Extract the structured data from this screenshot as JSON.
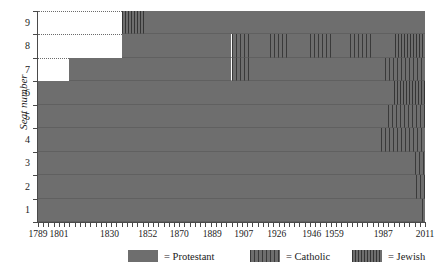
{
  "chart_data": {
    "type": "area",
    "title": "",
    "xlabel": "",
    "ylabel": "Seat number",
    "xlim": [
      1789,
      2011
    ],
    "ylim": [
      0,
      9
    ],
    "grid": false,
    "legend_position": "bottom",
    "x_tick_labels": [
      "1789",
      "1801",
      "1830",
      "1852",
      "1870",
      "1889",
      "1907",
      "1926",
      "1946",
      "1959",
      "1987",
      "2011"
    ],
    "y_tick_labels": [
      "1",
      "2",
      "3",
      "4",
      "5",
      "6",
      "7",
      "8",
      "9"
    ],
    "categories": [
      "Protestant",
      "Catholic",
      "Jewish"
    ],
    "series": [
      {
        "name": "Protestant",
        "pattern": "solid-gray",
        "color": "#6e6e6e"
      },
      {
        "name": "Catholic",
        "pattern": "vertical-lines-wide",
        "color": "#3a3a3a"
      },
      {
        "name": "Jewish",
        "pattern": "vertical-lines-dense",
        "color": "#353535"
      }
    ],
    "seat_start_years": {
      "seat_1": 1789,
      "seat_2": 1789,
      "seat_3": 1789,
      "seat_4": 1789,
      "seat_5": 1789,
      "seat_6": 1789,
      "seat_7": 1807,
      "seat_8": 1837,
      "seat_9": 1837
    },
    "seat_timelines": [
      {
        "seat": 9,
        "segments": [
          {
            "start": 1837,
            "end": 1851,
            "faith": "Jewish"
          },
          {
            "start": 1851,
            "end": 2011,
            "faith": "Protestant"
          }
        ]
      },
      {
        "seat": 8,
        "segments": [
          {
            "start": 1837,
            "end": 1900,
            "faith": "Protestant"
          },
          {
            "start": 1900,
            "end": 1911,
            "faith": "Catholic"
          },
          {
            "start": 1911,
            "end": 1922,
            "faith": "Protestant"
          },
          {
            "start": 1922,
            "end": 1933,
            "faith": "Catholic"
          },
          {
            "start": 1933,
            "end": 1945,
            "faith": "Protestant"
          },
          {
            "start": 1945,
            "end": 1957,
            "faith": "Catholic"
          },
          {
            "start": 1957,
            "end": 1968,
            "faith": "Protestant"
          },
          {
            "start": 1968,
            "end": 1980,
            "faith": "Catholic"
          },
          {
            "start": 1980,
            "end": 1994,
            "faith": "Protestant"
          },
          {
            "start": 1994,
            "end": 2011,
            "faith": "Jewish"
          }
        ]
      },
      {
        "seat": 7,
        "segments": [
          {
            "start": 1807,
            "end": 1900,
            "faith": "Protestant"
          },
          {
            "start": 1900,
            "end": 1912,
            "faith": "Catholic"
          },
          {
            "start": 1912,
            "end": 1988,
            "faith": "Protestant"
          },
          {
            "start": 1988,
            "end": 2011,
            "faith": "Catholic"
          }
        ]
      },
      {
        "seat": 6,
        "segments": [
          {
            "start": 1789,
            "end": 1993,
            "faith": "Protestant"
          },
          {
            "start": 1993,
            "end": 2011,
            "faith": "Jewish"
          }
        ]
      },
      {
        "seat": 5,
        "segments": [
          {
            "start": 1789,
            "end": 1990,
            "faith": "Protestant"
          },
          {
            "start": 1990,
            "end": 2011,
            "faith": "Catholic"
          }
        ]
      },
      {
        "seat": 4,
        "segments": [
          {
            "start": 1789,
            "end": 1986,
            "faith": "Protestant"
          },
          {
            "start": 1986,
            "end": 2011,
            "faith": "Catholic"
          }
        ]
      },
      {
        "seat": 3,
        "segments": [
          {
            "start": 1789,
            "end": 2005,
            "faith": "Protestant"
          },
          {
            "start": 2005,
            "end": 2011,
            "faith": "Catholic"
          }
        ]
      },
      {
        "seat": 2,
        "segments": [
          {
            "start": 1789,
            "end": 2006,
            "faith": "Protestant"
          },
          {
            "start": 2006,
            "end": 2011,
            "faith": "Catholic"
          }
        ]
      },
      {
        "seat": 1,
        "segments": [
          {
            "start": 1789,
            "end": 2009,
            "faith": "Protestant"
          },
          {
            "start": 2009,
            "end": 2011,
            "faith": "Catholic"
          }
        ]
      }
    ]
  },
  "axes": {
    "y_title": "Seat number",
    "y_ticks": [
      "9",
      "8",
      "7",
      "6",
      "5",
      "4",
      "3",
      "2",
      "1"
    ],
    "x_ticks": [
      "1789",
      "1801",
      "1830",
      "1852",
      "1870",
      "1889",
      "1907",
      "1926",
      "1946",
      "1959",
      "1987",
      "2011"
    ]
  },
  "legend": {
    "items": [
      {
        "label": "= Protestant",
        "swatch": "protestant-swatch"
      },
      {
        "label": "= Catholic",
        "swatch": "catholic-swatch"
      },
      {
        "label": "= Jewish",
        "swatch": "jewish-swatch"
      }
    ]
  },
  "colors": {
    "protestant": "#6e6e6e",
    "catholic_lines": "#3a3a3a",
    "jewish_lines": "#353535",
    "axis": "#4a4a4a",
    "text": "#1a1a1a",
    "background": "#ffffff"
  }
}
